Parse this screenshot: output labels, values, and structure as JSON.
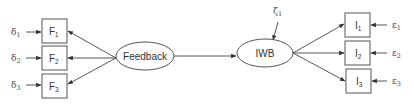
{
  "diagram": {
    "type": "structural-equation-model",
    "latent": {
      "feedback": {
        "label": "Feedback"
      },
      "iwb": {
        "label": "IWB",
        "disturbance": {
          "symbol": "ζ",
          "sub": "1"
        }
      }
    },
    "feedback_indicators": [
      {
        "name": "F",
        "sub": "1",
        "error": {
          "symbol": "δ",
          "sub": "1"
        }
      },
      {
        "name": "F",
        "sub": "2",
        "error": {
          "symbol": "δ",
          "sub": "2"
        }
      },
      {
        "name": "F",
        "sub": "3",
        "error": {
          "symbol": "δ",
          "sub": "3"
        }
      }
    ],
    "iwb_indicators": [
      {
        "name": "I",
        "sub": "1",
        "error": {
          "symbol": "ε",
          "sub": "1"
        }
      },
      {
        "name": "I",
        "sub": "2",
        "error": {
          "symbol": "ε",
          "sub": "2"
        }
      },
      {
        "name": "I",
        "sub": "3",
        "error": {
          "symbol": "ε",
          "sub": "3"
        }
      }
    ],
    "edges": [
      {
        "from": "Feedback",
        "to": "F1"
      },
      {
        "from": "Feedback",
        "to": "F2"
      },
      {
        "from": "Feedback",
        "to": "F3"
      },
      {
        "from": "δ1",
        "to": "F1"
      },
      {
        "from": "δ2",
        "to": "F2"
      },
      {
        "from": "δ3",
        "to": "F3"
      },
      {
        "from": "Feedback",
        "to": "IWB"
      },
      {
        "from": "ζ1",
        "to": "IWB"
      },
      {
        "from": "IWB",
        "to": "I1"
      },
      {
        "from": "IWB",
        "to": "I2"
      },
      {
        "from": "IWB",
        "to": "I3"
      },
      {
        "from": "ε1",
        "to": "I1"
      },
      {
        "from": "ε2",
        "to": "I2"
      },
      {
        "from": "ε3",
        "to": "I3"
      }
    ]
  }
}
